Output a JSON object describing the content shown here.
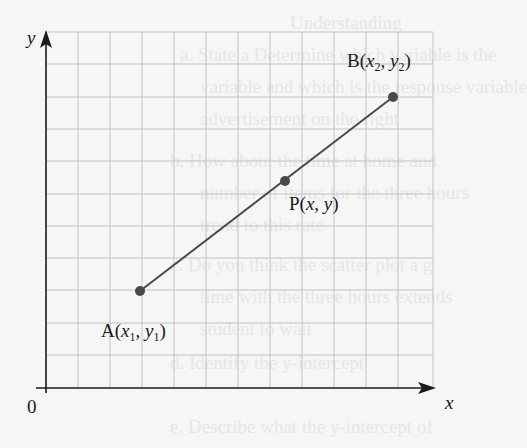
{
  "diagram": {
    "axes": {
      "x_label": "x",
      "y_label": "y",
      "origin_label": "0"
    },
    "grid": {
      "columns": 12,
      "rows": 11,
      "color": "#bdbdbd"
    },
    "points": [
      {
        "id": "A",
        "label_main": "A(",
        "label_x": "x",
        "sub_x": "1",
        "label_sep": ", ",
        "label_y": "y",
        "sub_y": "1",
        "label_close": ")",
        "grid": [
          3,
          3
        ]
      },
      {
        "id": "P",
        "label_main": "P(",
        "label_x": "x",
        "label_sep": ", ",
        "label_y": "y",
        "label_close": ")",
        "grid": [
          7.5,
          6.5
        ]
      },
      {
        "id": "B",
        "label_main": "B(",
        "label_x": "x",
        "sub_x": "2",
        "label_sep": ", ",
        "label_y": "y",
        "sub_y": "2",
        "label_close": ")",
        "grid": [
          11,
          9
        ]
      }
    ],
    "segment": {
      "from": "A",
      "to": "B",
      "color": "#4a4a4a"
    },
    "point_color": "#4a4a4a",
    "axis_color": "#1a1a1a"
  },
  "ghost_text": [
    "Understanding",
    "a. State a Determine which variable is the",
    "variable and which is the response variable",
    "advertisement on the right",
    "b. How about the time at home and",
    "number of items for the three hours",
    "trend to this rate",
    "c. Do you think the scatter plot a g",
    "time with the three hours extends",
    "student to wait",
    "d. Identify the y-intercept",
    "e. Describe what the y-intercept of"
  ]
}
